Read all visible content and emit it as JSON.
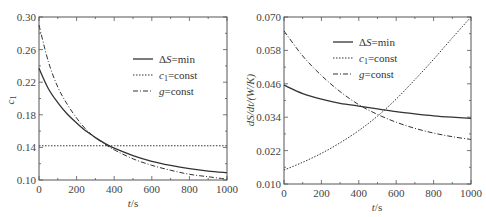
{
  "chart_data": [
    {
      "type": "line",
      "title": "",
      "xlabel": "t/s",
      "ylabel": "c1",
      "xlim": [
        0,
        1000
      ],
      "ylim": [
        0.1,
        0.3
      ],
      "xticks": [
        "0",
        "200",
        "400",
        "600",
        "800",
        "1000"
      ],
      "yticks": [
        "0.10",
        "0.14",
        "0.18",
        "0.22",
        "0.26",
        "0.30"
      ],
      "grid": false,
      "legend_position": "upper right",
      "x": [
        0,
        50,
        100,
        150,
        200,
        250,
        300,
        350,
        400,
        500,
        600,
        700,
        800,
        900,
        1000
      ],
      "series": [
        {
          "name": "ΔS=min",
          "style": "solid",
          "values": [
            0.237,
            0.212,
            0.195,
            0.181,
            0.17,
            0.16,
            0.152,
            0.145,
            0.139,
            0.13,
            0.123,
            0.118,
            0.114,
            0.111,
            0.109
          ]
        },
        {
          "name": "c1=const",
          "style": "dotted",
          "values": [
            0.142,
            0.142,
            0.142,
            0.142,
            0.142,
            0.142,
            0.142,
            0.142,
            0.142,
            0.142,
            0.142,
            0.142,
            0.142,
            0.142,
            0.142
          ]
        },
        {
          "name": "g=const",
          "style": "dashdot",
          "values": [
            0.29,
            0.245,
            0.214,
            0.193,
            0.176,
            0.162,
            0.152,
            0.144,
            0.137,
            0.126,
            0.118,
            0.112,
            0.107,
            0.104,
            0.101
          ]
        }
      ]
    },
    {
      "type": "line",
      "title": "",
      "xlabel": "t/s",
      "ylabel": "dS/dt/(W/K)",
      "xlim": [
        0,
        1000
      ],
      "ylim": [
        0.01,
        0.07
      ],
      "xticks": [
        "0",
        "200",
        "400",
        "600",
        "800",
        "1000"
      ],
      "yticks": [
        "0.010",
        "0.022",
        "0.034",
        "0.046",
        "0.058",
        "0.070"
      ],
      "grid": false,
      "legend_position": "upper left",
      "x": [
        0,
        100,
        200,
        300,
        400,
        500,
        600,
        700,
        800,
        900,
        1000
      ],
      "series": [
        {
          "name": "ΔS=min",
          "style": "solid",
          "values": [
            0.0455,
            0.0425,
            0.0405,
            0.039,
            0.038,
            0.037,
            0.036,
            0.0352,
            0.0345,
            0.034,
            0.0336
          ]
        },
        {
          "name": "c1=const",
          "style": "dotted",
          "values": [
            0.015,
            0.0178,
            0.021,
            0.0248,
            0.0292,
            0.0344,
            0.0405,
            0.0475,
            0.0548,
            0.0625,
            0.07
          ]
        },
        {
          "name": "g=const",
          "style": "dashdot",
          "values": [
            0.065,
            0.056,
            0.049,
            0.0432,
            0.0385,
            0.035,
            0.0322,
            0.03,
            0.0283,
            0.027,
            0.026
          ]
        }
      ]
    }
  ],
  "charts": {
    "left": {
      "ylabel": "c",
      "ylabel_sub": "1",
      "xlabel_italic": "t",
      "xlabel_rest": "/s",
      "yticks": [
        "0.30",
        "0.26",
        "0.22",
        "0.18",
        "0.14",
        "0.10"
      ],
      "xticks": [
        "0",
        "200",
        "400",
        "600",
        "800",
        "1000"
      ],
      "legend": [
        {
          "prefix": "Δ",
          "italic": "S",
          "rest": "=min"
        },
        {
          "prefix": "",
          "italic": "c",
          "sub": "1",
          "rest": "=const"
        },
        {
          "prefix": "",
          "italic": "g",
          "rest": "=const"
        }
      ]
    },
    "right": {
      "ylabel": "dS/dt/(W/K)",
      "xlabel_italic": "t",
      "xlabel_rest": "/s",
      "yticks": [
        "0.070",
        "0.058",
        "0.046",
        "0.034",
        "0.022",
        "0.010"
      ],
      "xticks": [
        "0",
        "200",
        "400",
        "600",
        "800",
        "1000"
      ],
      "legend": [
        {
          "prefix": "Δ",
          "italic": "S",
          "rest": "=min"
        },
        {
          "prefix": "",
          "italic": "c",
          "sub": "1",
          "rest": "=const"
        },
        {
          "prefix": "",
          "italic": "g",
          "rest": "=const"
        }
      ]
    }
  }
}
